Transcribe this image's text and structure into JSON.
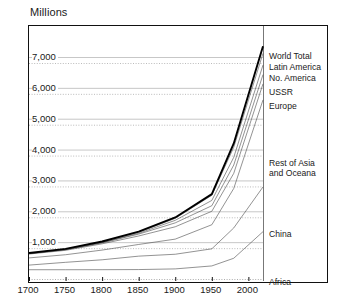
{
  "chart_data": {
    "type": "line",
    "title": "",
    "ylabel": "Millions",
    "xlabel": "",
    "xlim": [
      1700,
      2020
    ],
    "ylim": [
      0,
      7600
    ],
    "grid": true,
    "legend_position": "right-inline",
    "x": [
      1700,
      1750,
      1800,
      1850,
      1900,
      1950,
      1980,
      2020
    ],
    "y_ticks": [
      1000,
      2000,
      3000,
      4000,
      5000,
      6000,
      7000
    ],
    "y_tick_labels": [
      "1,000",
      "2,000",
      "3,000",
      "4,000",
      "5,000",
      "6,000",
      "7,000"
    ],
    "x_ticks": [
      1700,
      1750,
      1800,
      1850,
      1900,
      1950,
      2000
    ],
    "x_tick_labels": [
      "1700",
      "1750",
      "1800",
      "1850",
      "1900",
      "1950",
      "2000"
    ],
    "stacked": true,
    "note": "Cumulative stacked lines; top line is World Total",
    "series": [
      {
        "name": "Africa",
        "label": "Africa",
        "cumulative": [
          106,
          106,
          107,
          111,
          133,
          229,
          478,
          1340
        ],
        "width": 0.6
      },
      {
        "name": "China",
        "label": "China",
        "cumulative": [
          256,
          346,
          428,
          546,
          608,
          783,
          1460,
          2790
        ],
        "width": 0.6
      },
      {
        "name": "Rest of Asia and Oceana",
        "label": "Rest of Asia\nand Oceana",
        "cumulative": [
          489,
          592,
          743,
          925,
          1098,
          1564,
          2740,
          5610
        ],
        "width": 0.6
      },
      {
        "name": "Europe",
        "label": "Europe",
        "cumulative": [
          614,
          735,
          946,
          1200,
          1498,
          2000,
          3230,
          6130
        ],
        "width": 0.6
      },
      {
        "name": "USSR",
        "label": "USSR",
        "cumulative": [
          629,
          755,
          977,
          1260,
          1625,
          2180,
          3500,
          6430
        ],
        "width": 0.6
      },
      {
        "name": "No. America",
        "label": "No. America",
        "cumulative": [
          630,
          757,
          984,
          1286,
          1707,
          2352,
          3750,
          6740
        ],
        "width": 0.6
      },
      {
        "name": "Latin America",
        "label": "Latin America",
        "cumulative": [
          640,
          773,
          1008,
          1319,
          1771,
          2519,
          4075,
          7120
        ],
        "width": 0.6
      },
      {
        "name": "World Total",
        "label": "World Total",
        "cumulative": [
          646,
          783,
          1022,
          1341,
          1800,
          2556,
          4200,
          7350
        ],
        "width": 1.9
      }
    ],
    "legend_entries": [
      {
        "label": "World Total",
        "two_line": false
      },
      {
        "label": "Latin America",
        "two_line": false
      },
      {
        "label": "No. America",
        "two_line": false
      },
      {
        "label": "USSR",
        "two_line": false
      },
      {
        "label": "Europe",
        "two_line": false
      },
      {
        "label": "Rest of Asia",
        "label2": "and Oceana",
        "two_line": true
      },
      {
        "label": "China",
        "two_line": false
      },
      {
        "label": "Africa",
        "two_line": false
      }
    ]
  }
}
